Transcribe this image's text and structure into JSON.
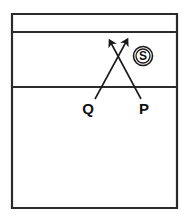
{
  "figure": {
    "title": "",
    "background_color": "#ffffff",
    "stroke_color": "#2b2b2b",
    "text_color": "#111111"
  },
  "frame": {
    "name": "outer-rectangle",
    "left": 12,
    "top": 14,
    "right": 177,
    "bottom": 208,
    "stroke_width": 2.2
  },
  "interface_lines": [
    {
      "name": "upper-interface",
      "y": 32,
      "x1": 12,
      "x2": 177,
      "stroke_width": 1.8
    },
    {
      "name": "lower-interface",
      "y": 87,
      "x1": 12,
      "x2": 177,
      "stroke_width": 1.8
    }
  ],
  "rays": [
    {
      "name": "ray-q",
      "label": "Q",
      "from": {
        "x": 95,
        "y": 99
      },
      "to": {
        "x": 126,
        "y": 42
      },
      "arrowhead": true,
      "label_pos": {
        "x": 88,
        "y": 114
      }
    },
    {
      "name": "ray-p",
      "label": "P",
      "from": {
        "x": 141,
        "y": 99
      },
      "to": {
        "x": 111,
        "y": 43
      },
      "arrowhead": true,
      "label_pos": {
        "x": 144,
        "y": 114
      }
    }
  ],
  "source_marker": {
    "name": "source-s",
    "label": "S",
    "center": {
      "x": 143,
      "y": 56
    },
    "outer_radius": 9.5,
    "inner_radius": 7.0
  },
  "crossing_point": {
    "x": 119,
    "y": 58
  }
}
